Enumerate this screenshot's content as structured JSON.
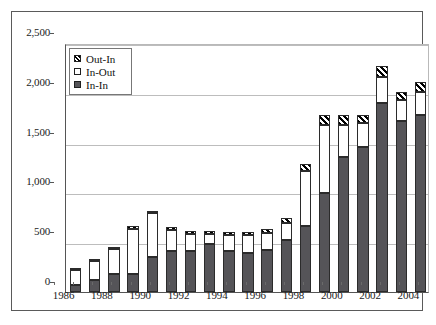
{
  "chart_data": {
    "type": "bar",
    "subtype": "stacked",
    "title": "",
    "subtitle": "",
    "xlabel": "",
    "ylabel": "",
    "ylim": [
      0,
      2500
    ],
    "ytick_values": [
      0,
      500,
      1000,
      1500,
      2000,
      2500
    ],
    "ytick_labels": [
      "0",
      "500",
      "1,000",
      "1,500",
      "2,000",
      "2,500"
    ],
    "grid": "horizontal",
    "legend_position": "top-left",
    "categories": [
      "1986",
      "1987",
      "1988",
      "1989",
      "1990",
      "1991",
      "1992",
      "1993",
      "1994",
      "1995",
      "1996",
      "1997",
      "1998",
      "1999",
      "2000",
      "2001",
      "2002",
      "2003",
      "2004"
    ],
    "xtick_labels_shown": [
      "1986",
      "1988",
      "1990",
      "1992",
      "1994",
      "1996",
      "1998",
      "2000",
      "2002",
      "2004"
    ],
    "series": [
      {
        "name": "In-In",
        "fill": "solid-dark",
        "color": "#555458",
        "values": [
          70,
          120,
          180,
          185,
          350,
          410,
          415,
          480,
          410,
          390,
          425,
          520,
          660,
          995,
          1355,
          1460,
          1900,
          1720,
          1775
        ]
      },
      {
        "name": "In-Out",
        "fill": "white",
        "color": "#ffffff",
        "values": [
          150,
          190,
          250,
          450,
          440,
          215,
          165,
          100,
          160,
          180,
          170,
          175,
          560,
          680,
          320,
          235,
          255,
          210,
          230
        ]
      },
      {
        "name": "Out-In",
        "fill": "diagonal-hatch",
        "color": "#000000",
        "values": [
          5,
          5,
          5,
          20,
          10,
          10,
          30,
          30,
          30,
          30,
          35,
          45,
          70,
          100,
          105,
          80,
          110,
          80,
          105
        ]
      }
    ],
    "totals": [
      225,
      315,
      435,
      655,
      800,
      635,
      610,
      610,
      600,
      600,
      630,
      740,
      1290,
      1775,
      1780,
      1775,
      2265,
      2010,
      2110
    ]
  },
  "legend": {
    "entries": [
      {
        "label": "Out-In",
        "swatch": "hatch-swatch"
      },
      {
        "label": "In-Out",
        "swatch": "white-swatch"
      },
      {
        "label": "In-In",
        "swatch": "dark-swatch"
      }
    ]
  }
}
